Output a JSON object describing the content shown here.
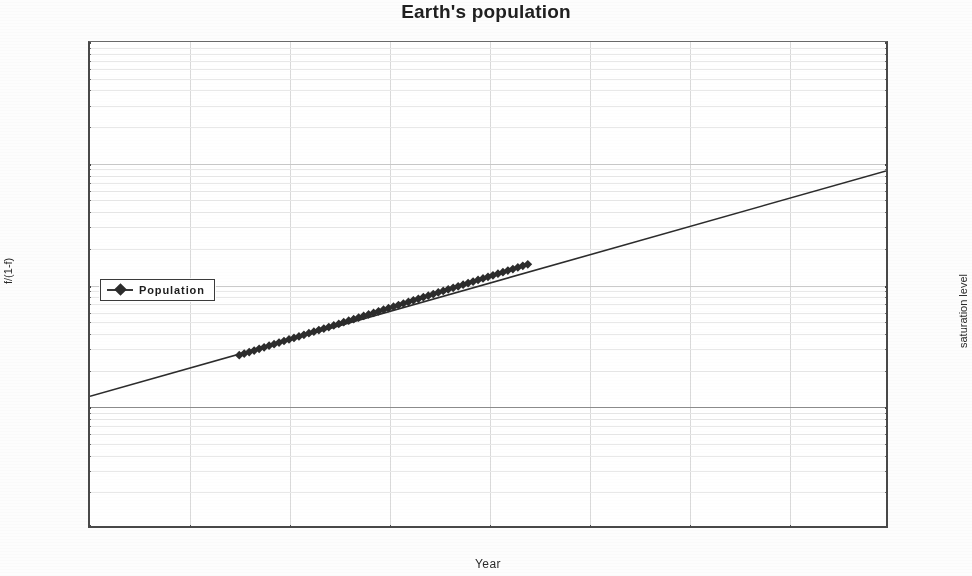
{
  "chart_data": {
    "type": "line",
    "title": "Earth's population",
    "xlabel": "Year",
    "ylabel_left": "f/(1-f)",
    "ylabel_right": "saturation level",
    "xlim": [
      1920,
      2080
    ],
    "ylim": [
      0.01,
      100
    ],
    "yscale": "log",
    "grid": true,
    "legend_position": "left-center",
    "x_ticks": [
      1920,
      1940,
      1960,
      1980,
      2000,
      2020,
      2040,
      2060,
      2080
    ],
    "x_tick_labels": [
      "1920",
      "1940",
      "1960",
      "1980",
      "2000",
      "2020",
      "2040",
      "2060",
      "2080"
    ],
    "y_ticks_left": [
      0.01,
      0.1,
      1,
      10,
      100
    ],
    "y_tick_labels_left": [
      "0 01",
      "0 10",
      "1 00",
      "10 00",
      "100 00"
    ],
    "y_ticks_right": [
      0.01,
      0.1,
      1,
      10,
      100
    ],
    "y_tick_labels_right": [
      "1 %",
      "10 %",
      "50 %",
      "90 %",
      "99 %"
    ],
    "series": [
      {
        "name": "Population",
        "marker": "diamond",
        "color": "#2e2e2e",
        "trend_line": {
          "x": [
            1920,
            2080
          ],
          "y": [
            0.118,
            8.6
          ],
          "description": "straight line on log axis from 1920 to 2080"
        },
        "x": [
          1950,
          1951,
          1952,
          1953,
          1954,
          1955,
          1956,
          1957,
          1958,
          1959,
          1960,
          1961,
          1962,
          1963,
          1964,
          1965,
          1966,
          1967,
          1968,
          1969,
          1970,
          1971,
          1972,
          1973,
          1974,
          1975,
          1976,
          1977,
          1978,
          1979,
          1980,
          1981,
          1982,
          1983,
          1984,
          1985,
          1986,
          1987,
          1988,
          1989,
          1990,
          1991,
          1992,
          1993,
          1994,
          1995,
          1996,
          1997,
          1998,
          1999,
          2000,
          2001,
          2002,
          2003,
          2004,
          2005,
          2006,
          2007,
          2008
        ],
        "y": [
          0.258,
          0.266,
          0.274,
          0.282,
          0.291,
          0.3,
          0.309,
          0.318,
          0.328,
          0.338,
          0.348,
          0.358,
          0.369,
          0.38,
          0.392,
          0.404,
          0.416,
          0.428,
          0.441,
          0.455,
          0.468,
          0.483,
          0.497,
          0.512,
          0.528,
          0.544,
          0.56,
          0.577,
          0.595,
          0.613,
          0.631,
          0.65,
          0.67,
          0.69,
          0.711,
          0.733,
          0.755,
          0.778,
          0.801,
          0.826,
          0.851,
          0.876,
          0.903,
          0.93,
          0.958,
          0.987,
          1.017,
          1.048,
          1.08,
          1.112,
          1.146,
          1.181,
          1.216,
          1.253,
          1.291,
          1.33,
          1.37,
          1.412,
          1.455
        ]
      }
    ],
    "annotations": [
      "solid reference line at f/(1-f) = 0.10 (10 % saturation level)"
    ]
  },
  "legend": {
    "entries": [
      {
        "label": "Population",
        "marker": "diamond-marker"
      }
    ]
  },
  "colors": {
    "series": "#2e2e2e",
    "axis": "#4a4a4a",
    "grid_major": "#c9c9c9",
    "grid_minor": "#e6e6e6",
    "background": "#fdfdfd",
    "text": "#2b2b2b"
  }
}
